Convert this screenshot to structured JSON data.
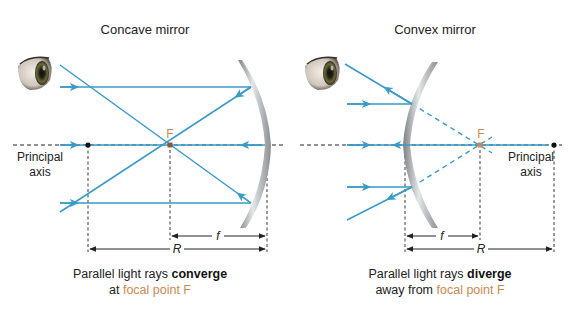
{
  "colors": {
    "ray": "#3a9ac8",
    "focal": "#c98a52",
    "axis": "#222222",
    "mirror": "#a9aeb1"
  },
  "concave": {
    "title": "Concave mirror",
    "axis_label_line1": "Principal",
    "axis_label_line2": "axis",
    "focal_label": "F",
    "f_label": "f",
    "r_label": "R",
    "caption_line1_pre": "Parallel light rays ",
    "caption_line1_bold": "converge",
    "caption_line2_pre": "at ",
    "caption_line2_accent": "focal point F"
  },
  "convex": {
    "title": "Convex mirror",
    "axis_label_line1": "Principal",
    "axis_label_line2": "axis",
    "focal_label": "F",
    "f_label": "f",
    "r_label": "R",
    "caption_line1_pre": "Parallel light rays ",
    "caption_line1_bold": "diverge",
    "caption_line2_pre": "away from ",
    "caption_line2_accent": "focal point F"
  }
}
